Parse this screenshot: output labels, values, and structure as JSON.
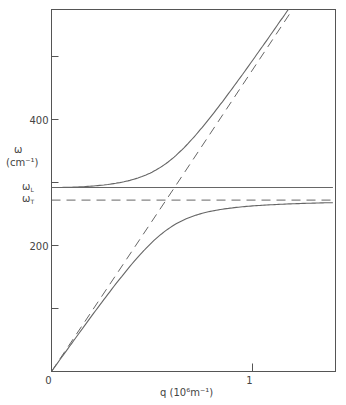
{
  "chart_data": {
    "type": "line",
    "title": "",
    "xlabel": "q (10⁶m⁻¹)",
    "ylabel_symbol": "ω",
    "ylabel_unit": "(cm⁻¹)",
    "xlim": [
      0,
      1.4
    ],
    "ylim": [
      0,
      575
    ],
    "x_ticks": [
      {
        "value": 0,
        "label": "0"
      },
      {
        "value": 1,
        "label": "1"
      }
    ],
    "y_ticks": [
      {
        "value": 100,
        "label": ""
      },
      {
        "value": 200,
        "label": "200"
      },
      {
        "value": 300,
        "label": ""
      },
      {
        "value": 400,
        "label": "400"
      },
      {
        "value": 500,
        "label": ""
      }
    ],
    "omega_L": 292,
    "omega_T": 272,
    "omega_L_label": "ωL",
    "omega_T_label": "ωT",
    "light_line_slope": 477,
    "grid": false,
    "series": [
      {
        "name": "upper polariton branch",
        "style": "solid",
        "points": [
          [
            0,
            292
          ],
          [
            0.3,
            300
          ],
          [
            0.5,
            330
          ],
          [
            0.7,
            380
          ],
          [
            0.89,
            438
          ],
          [
            1.0,
            490
          ],
          [
            1.2,
            575
          ]
        ]
      },
      {
        "name": "lower polariton branch",
        "style": "solid",
        "points": [
          [
            0,
            0
          ],
          [
            0.2,
            88
          ],
          [
            0.4,
            170
          ],
          [
            0.5,
            210
          ],
          [
            0.7,
            245
          ],
          [
            1.0,
            262
          ],
          [
            1.4,
            268
          ]
        ]
      },
      {
        "name": "photon line (ω = cq/√ε∞)",
        "style": "dashed",
        "points": [
          [
            0,
            0
          ],
          [
            0.612,
            292
          ],
          [
            1.2,
            575
          ]
        ]
      },
      {
        "name": "ωT",
        "style": "dashed",
        "points": [
          [
            0,
            272
          ],
          [
            1.4,
            272
          ]
        ]
      },
      {
        "name": "ωL",
        "style": "solid",
        "points": [
          [
            0,
            292
          ],
          [
            1.4,
            292
          ]
        ]
      }
    ]
  }
}
